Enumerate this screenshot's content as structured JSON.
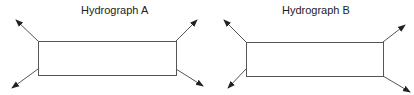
{
  "diagrams": [
    {
      "title": "Hydrograph A",
      "box": {
        "x": 38,
        "y": 41,
        "w": 138,
        "h": 34
      },
      "arrows": [
        [
          38,
          41,
          16,
          20
        ],
        [
          38,
          69,
          12,
          88
        ],
        [
          176,
          41,
          197,
          20
        ],
        [
          176,
          69,
          203,
          86
        ]
      ]
    },
    {
      "title": "Hydrograph B",
      "box": {
        "x": 246,
        "y": 42,
        "w": 137,
        "h": 34
      },
      "arrows": [
        [
          246,
          42,
          224,
          20
        ],
        [
          246,
          69,
          228,
          88
        ],
        [
          383,
          42,
          405,
          25
        ],
        [
          383,
          76,
          410,
          92
        ]
      ]
    }
  ],
  "colors": {
    "line": "#555555",
    "arrow": "#222222"
  }
}
